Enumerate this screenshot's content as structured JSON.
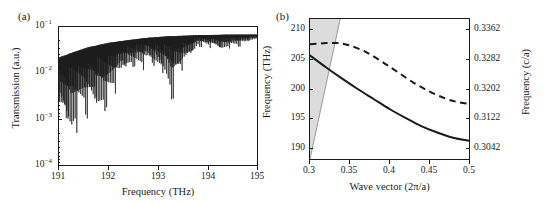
{
  "figure": {
    "panels": [
      {
        "tag": "(a)",
        "xlabel": "Frequency (THz)",
        "ylabel": "Transmission (a.u.)",
        "xticks": [
          "191",
          "192",
          "193",
          "194",
          "195"
        ],
        "yticks": [
          "10",
          "10",
          "10",
          "10"
        ],
        "yexponents": [
          "−1",
          "−2",
          "−3",
          "−4"
        ]
      },
      {
        "tag": "(b)",
        "xlabel": "Wave vector (2π/a)",
        "ylabel_left": "Frequency (THz)",
        "ylabel_right": "Frequency (c/a)",
        "xticks": [
          "0.3",
          "0.35",
          "0.4",
          "0.45",
          "0.5"
        ],
        "yticks_left": [
          "190",
          "195",
          "200",
          "205",
          "210"
        ],
        "yticks_right": [
          "0.3042",
          "0.3122",
          "0.3202",
          "0.3282",
          "0.3362"
        ]
      }
    ]
  },
  "colors": {
    "line": "#1a1a1a",
    "shade": "#dcdcdc",
    "shade_edge": "#9a9a9a",
    "background": "#ffffff"
  },
  "chart_data": [
    {
      "type": "line",
      "panel": "(a)",
      "title": "",
      "xlabel": "Frequency (THz)",
      "ylabel": "Transmission (a.u.)",
      "xlim": [
        191,
        195
      ],
      "ylim": [
        0.0001,
        0.15
      ],
      "yscale": "log",
      "grid": false,
      "legend": "none",
      "description": "Dense Fabry-Perot transmission spectrum; envelope rises from ~3e-2 at 191 THz toward ~1e-1 plateau above 193 THz. Sharp resonant dips reach down to ~3e-4 near 191.2 THz and become progressively shallower at higher frequency.",
      "series": [
        {
          "name": "Transmission",
          "envelope_upper": [
            {
              "x": 191.0,
              "y": 0.03
            },
            {
              "x": 191.3,
              "y": 0.04
            },
            {
              "x": 191.6,
              "y": 0.052
            },
            {
              "x": 192.0,
              "y": 0.065
            },
            {
              "x": 192.4,
              "y": 0.075
            },
            {
              "x": 192.8,
              "y": 0.085
            },
            {
              "x": 193.2,
              "y": 0.092
            },
            {
              "x": 193.8,
              "y": 0.097
            },
            {
              "x": 194.4,
              "y": 0.1
            },
            {
              "x": 195.0,
              "y": 0.1
            }
          ],
          "envelope_lower": [
            {
              "x": 191.0,
              "y": 0.0006
            },
            {
              "x": 191.2,
              "y": 0.00035
            },
            {
              "x": 191.5,
              "y": 0.001
            },
            {
              "x": 191.9,
              "y": 0.0012
            },
            {
              "x": 192.3,
              "y": 0.012
            },
            {
              "x": 192.8,
              "y": 0.02
            },
            {
              "x": 193.3,
              "y": 0.0045
            },
            {
              "x": 193.8,
              "y": 0.055
            },
            {
              "x": 194.3,
              "y": 0.04
            },
            {
              "x": 195.0,
              "y": 0.075
            }
          ]
        }
      ]
    },
    {
      "type": "line",
      "panel": "(b)",
      "title": "",
      "xlabel": "Wave vector (2π/a)",
      "ylabel": "Frequency (THz)",
      "ylabel_secondary": "Frequency (c/a)",
      "xlim": [
        0.3,
        0.5
      ],
      "ylim": [
        188.0,
        211.8
      ],
      "ylim_secondary": [
        0.30102,
        0.33902
      ],
      "grid": false,
      "legend": "none",
      "shaded_region": {
        "name": "light-cone",
        "description": "Grey shaded triangle bounded on the right by the light line, spanning from the left axis; light line passes from (0.3, 188) to (0.338, 211.8) exiting the top of the frame.",
        "light_line": [
          {
            "x": 0.3,
            "y": 188.0
          },
          {
            "x": 0.338,
            "y": 211.8
          }
        ]
      },
      "series": [
        {
          "name": "solid-band",
          "style": "solid",
          "points": [
            {
              "x": 0.3,
              "y": 205.6
            },
            {
              "x": 0.32,
              "y": 203.6
            },
            {
              "x": 0.34,
              "y": 201.7
            },
            {
              "x": 0.36,
              "y": 199.9
            },
            {
              "x": 0.38,
              "y": 198.2
            },
            {
              "x": 0.4,
              "y": 196.5
            },
            {
              "x": 0.42,
              "y": 195.0
            },
            {
              "x": 0.44,
              "y": 193.6
            },
            {
              "x": 0.46,
              "y": 192.5
            },
            {
              "x": 0.48,
              "y": 191.6
            },
            {
              "x": 0.5,
              "y": 191.1
            }
          ]
        },
        {
          "name": "dashed-band",
          "style": "dashed",
          "points": [
            {
              "x": 0.3,
              "y": 207.5
            },
            {
              "x": 0.32,
              "y": 207.7
            },
            {
              "x": 0.335,
              "y": 207.7
            },
            {
              "x": 0.35,
              "y": 207.3
            },
            {
              "x": 0.37,
              "y": 206.2
            },
            {
              "x": 0.39,
              "y": 204.6
            },
            {
              "x": 0.41,
              "y": 202.8
            },
            {
              "x": 0.43,
              "y": 201.0
            },
            {
              "x": 0.45,
              "y": 199.5
            },
            {
              "x": 0.47,
              "y": 198.3
            },
            {
              "x": 0.485,
              "y": 197.7
            },
            {
              "x": 0.5,
              "y": 197.4
            }
          ]
        }
      ]
    }
  ]
}
